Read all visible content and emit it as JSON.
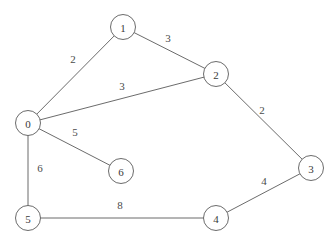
{
  "figure": {
    "type": "undirected-weighted-graph",
    "width": 335,
    "height": 242,
    "background_color": "#ffffff",
    "stroke_color": "#5a5a5a",
    "label_color": "#3a3a3a",
    "node_radius": 12.5
  },
  "chart_data": {
    "type": "diagram",
    "title": "",
    "nodes": [
      {
        "id": "0",
        "label": "0",
        "x": 28,
        "y": 123
      },
      {
        "id": "1",
        "label": "1",
        "x": 123,
        "y": 27
      },
      {
        "id": "2",
        "label": "2",
        "x": 216,
        "y": 74
      },
      {
        "id": "3",
        "label": "3",
        "x": 311,
        "y": 168
      },
      {
        "id": "4",
        "label": "4",
        "x": 216,
        "y": 218
      },
      {
        "id": "5",
        "label": "5",
        "x": 28,
        "y": 218
      },
      {
        "id": "6",
        "label": "6",
        "x": 121,
        "y": 171
      }
    ],
    "edges": [
      {
        "from": "0",
        "to": "1",
        "weight": "2",
        "label_x": 73,
        "label_y": 59
      },
      {
        "from": "1",
        "to": "2",
        "weight": "3",
        "label_x": 168,
        "label_y": 38
      },
      {
        "from": "0",
        "to": "2",
        "weight": "3",
        "label_x": 122,
        "label_y": 86
      },
      {
        "from": "2",
        "to": "3",
        "weight": "2",
        "label_x": 262,
        "label_y": 110
      },
      {
        "from": "0",
        "to": "6",
        "weight": "5",
        "label_x": 75,
        "label_y": 132
      },
      {
        "from": "0",
        "to": "5",
        "weight": "6",
        "label_x": 40,
        "label_y": 168
      },
      {
        "from": "5",
        "to": "4",
        "weight": "8",
        "label_x": 120,
        "label_y": 205
      },
      {
        "from": "4",
        "to": "3",
        "weight": "4",
        "label_x": 264,
        "label_y": 181
      }
    ]
  }
}
